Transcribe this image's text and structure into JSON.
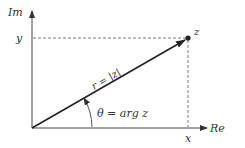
{
  "diagram": {
    "axes": {
      "vertical_label": "Im",
      "horizontal_label": "Re"
    },
    "point": {
      "label": "z",
      "x_label": "x",
      "y_label": "y"
    },
    "vector_label": "r = |z|",
    "angle_label": "θ = arg z",
    "colors": {
      "line": "#222222",
      "axis": "#444444",
      "text": "#333333"
    }
  }
}
